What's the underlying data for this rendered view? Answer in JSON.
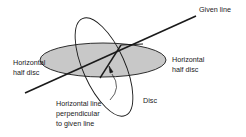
{
  "diagram": {
    "labels": {
      "given_line": "Given line",
      "left_half_disc_line1": "Horizontal",
      "left_half_disc_line2": "half disc",
      "right_half_disc_line1": "Horizontal",
      "right_half_disc_line2": "half disc",
      "disc": "Disc",
      "perp_line1": "Horizontal line",
      "perp_line2": "perpendicular",
      "perp_line3": "to given line"
    },
    "colors": {
      "half_disc_fill": "#c8c8c8",
      "stroke": "#1a1a1a",
      "background": "#ffffff"
    }
  }
}
